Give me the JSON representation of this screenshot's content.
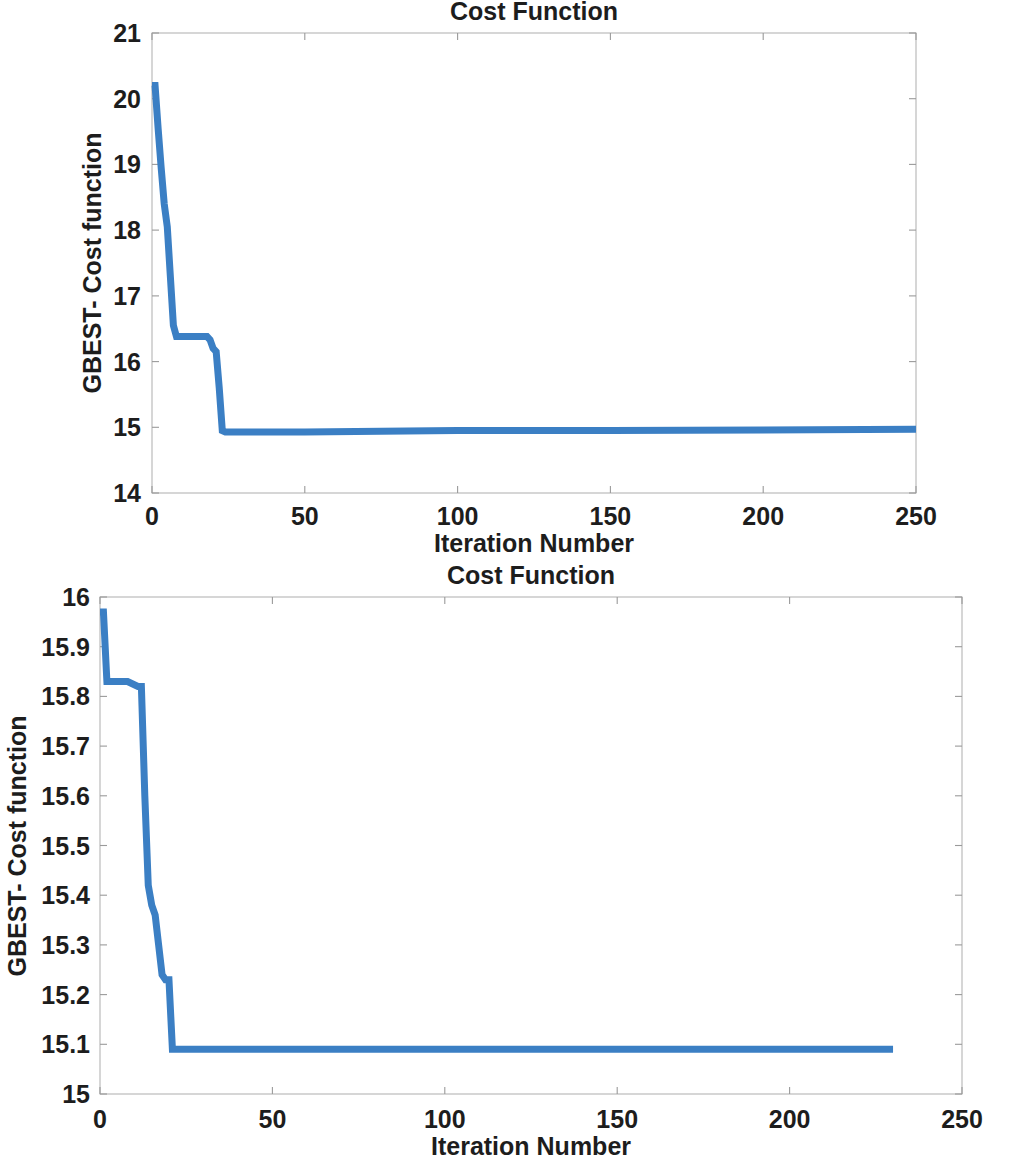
{
  "figure": {
    "background_color": "#ffffff",
    "line_color": "#3b7fc4",
    "axis_color": "#9a9a9a",
    "text_color": "#1d1d1d"
  },
  "charts": [
    {
      "id": "chart-top",
      "title": "Cost Function",
      "xlabel": "Iteration Number",
      "ylabel": "GBEST- Cost function",
      "xticks": [
        "0",
        "50",
        "100",
        "150",
        "200",
        "250"
      ],
      "yticks": [
        "14",
        "15",
        "16",
        "17",
        "18",
        "19",
        "20",
        "21"
      ]
    },
    {
      "id": "chart-bottom",
      "title": "Cost Function",
      "xlabel": "Iteration Number",
      "ylabel": "GBEST- Cost function",
      "xticks": [
        "0",
        "50",
        "100",
        "150",
        "200",
        "250"
      ],
      "yticks": [
        "15",
        "15.1",
        "15.2",
        "15.3",
        "15.4",
        "15.5",
        "15.6",
        "15.7",
        "15.8",
        "15.9",
        "16"
      ]
    }
  ],
  "chart_data": [
    {
      "type": "line",
      "title": "Cost Function",
      "xlabel": "Iteration Number",
      "ylabel": "GBEST- Cost function",
      "xlim": [
        0,
        250
      ],
      "ylim": [
        14,
        21
      ],
      "xticks": [
        0,
        50,
        100,
        150,
        200,
        250
      ],
      "yticks": [
        14,
        15,
        16,
        17,
        18,
        19,
        20,
        21
      ],
      "grid": false,
      "legend": null,
      "line_color": "#3b7fc4",
      "series": [
        {
          "name": "GBEST cost",
          "x": [
            0,
            1,
            2,
            3,
            4,
            5,
            6,
            7,
            8,
            10,
            14,
            18,
            19,
            20,
            21,
            22,
            23,
            24,
            30,
            50,
            100,
            150,
            200,
            250
          ],
          "y": [
            20.2,
            20.2,
            19.55,
            18.95,
            18.4,
            18.05,
            17.3,
            16.55,
            16.38,
            16.38,
            16.38,
            16.38,
            16.33,
            16.2,
            16.15,
            15.6,
            14.95,
            14.93,
            14.93,
            14.93,
            14.95,
            14.95,
            14.96,
            14.97
          ]
        }
      ]
    },
    {
      "type": "line",
      "title": "Cost Function",
      "xlabel": "Iteration Number",
      "ylabel": "GBEST- Cost function",
      "xlim": [
        0,
        250
      ],
      "ylim": [
        15,
        16
      ],
      "xticks": [
        0,
        50,
        100,
        150,
        200,
        250
      ],
      "yticks": [
        15,
        15.1,
        15.2,
        15.3,
        15.4,
        15.5,
        15.6,
        15.7,
        15.8,
        15.9,
        16
      ],
      "grid": false,
      "legend": null,
      "line_color": "#3b7fc4",
      "series": [
        {
          "name": "GBEST cost",
          "x": [
            0,
            1,
            2,
            3,
            4,
            8,
            11,
            12,
            13,
            14,
            15,
            16,
            17,
            18,
            19,
            20,
            21,
            30,
            60,
            100,
            150,
            200,
            230
          ],
          "y": [
            15.97,
            15.97,
            15.83,
            15.83,
            15.83,
            15.83,
            15.82,
            15.82,
            15.6,
            15.42,
            15.38,
            15.36,
            15.3,
            15.24,
            15.23,
            15.23,
            15.09,
            15.09,
            15.09,
            15.09,
            15.09,
            15.09,
            15.09
          ]
        }
      ]
    }
  ]
}
